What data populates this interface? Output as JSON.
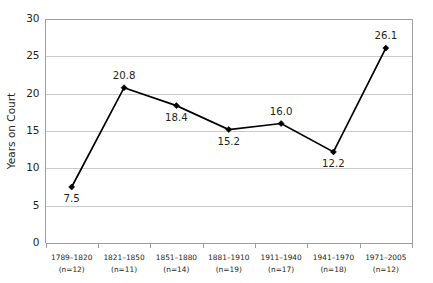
{
  "chart_data": {
    "type": "line",
    "title": "",
    "xlabel": "",
    "ylabel": "Years on Court",
    "ylim": [
      0,
      30
    ],
    "ytick_values": [
      0,
      5,
      10,
      15,
      20,
      25,
      30
    ],
    "ytick_labels": [
      "0",
      "5",
      "10",
      "15",
      "20",
      "25",
      "30"
    ],
    "grid": "horizontal",
    "legend": "none",
    "categories": [
      "1789–1820",
      "1821–1850",
      "1851–1880",
      "1881–1910",
      "1911–1940",
      "1941–1970",
      "1971–2005"
    ],
    "category_sublabels": [
      "(n=12)",
      "(n=11)",
      "(n=14)",
      "(n=19)",
      "(n=17)",
      "(n=18)",
      "(n=12)"
    ],
    "values": [
      7.5,
      20.8,
      18.4,
      15.2,
      16.0,
      12.2,
      26.1
    ],
    "value_labels": [
      "7.5",
      "20.8",
      "18.4",
      "15.2",
      "16.0",
      "12.2",
      "26.1"
    ],
    "value_label_positions": [
      "below",
      "above",
      "below",
      "below",
      "above",
      "below",
      "above"
    ],
    "series_color": "#000000",
    "grid_color": "#bcbec0",
    "axis_color": "#939598",
    "text_color": "#231f20",
    "marker": "diamond"
  }
}
